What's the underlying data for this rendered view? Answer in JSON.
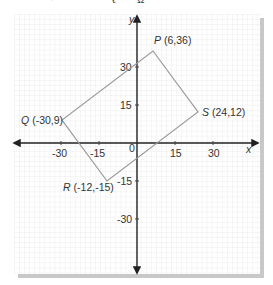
{
  "figure": {
    "top_cutoff_text": "… y … g Q …",
    "axes": {
      "x_label": "x",
      "y_label": "y",
      "origin_label": "0",
      "x_ticks": [
        {
          "value": -30,
          "label": "-30"
        },
        {
          "value": -15,
          "label": "-15"
        },
        {
          "value": 15,
          "label": "15"
        },
        {
          "value": 30,
          "label": "30"
        }
      ],
      "y_ticks": [
        {
          "value": 30,
          "label": "30"
        },
        {
          "value": 15,
          "label": "15"
        },
        {
          "value": -15,
          "label": "-15"
        },
        {
          "value": -30,
          "label": "-30"
        }
      ],
      "grid": true
    },
    "quadrilateral": {
      "vertices": [
        {
          "name": "P",
          "coords": "(6,36)",
          "x": 6,
          "y": 36
        },
        {
          "name": "S",
          "coords": "(24,12)",
          "x": 24,
          "y": 12
        },
        {
          "name": "R",
          "coords": "(-12,-15)",
          "x": -12,
          "y": -15
        },
        {
          "name": "Q",
          "coords": "(-30,9)",
          "x": -30,
          "y": 9
        }
      ],
      "order": [
        "P",
        "S",
        "R",
        "Q"
      ]
    },
    "colors": {
      "grid": "#e4e4e4",
      "axis": "#222222",
      "shape": "#9a9a9a",
      "shadow": "#c8c8c8",
      "text": "#333333"
    }
  }
}
